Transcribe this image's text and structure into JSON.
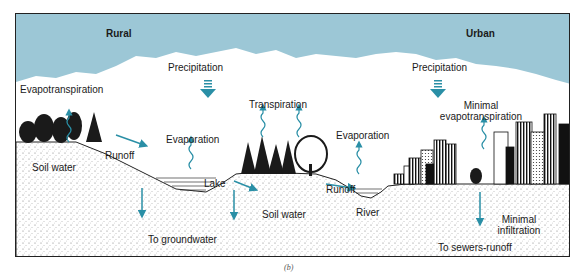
{
  "diagram": {
    "caption": "(b)",
    "colors": {
      "sky": "#9cc7d6",
      "arrow": "#2a8fa6",
      "ink": "#1a1a1a",
      "ground_stipple": "#555555"
    },
    "regions": {
      "rural": "Rural",
      "urban": "Urban"
    },
    "labels": {
      "rural_precipitation": "Precipitation",
      "urban_precipitation": "Precipitation",
      "evapotranspiration": "Evapotranspiration",
      "transpiration": "Transpiration",
      "evaporation_lake": "Evaporation",
      "evaporation_river": "Evaporation",
      "minimal_evapotranspiration_line1": "Minimal",
      "minimal_evapotranspiration_line2": "evapotranspiration",
      "runoff_rural": "Runoff",
      "runoff_river": "Runoff",
      "soil_water_left": "Soil water",
      "soil_water_right": "Soil water",
      "lake": "Lake",
      "river": "River",
      "to_groundwater": "To groundwater",
      "minimal_infiltration_line1": "Minimal",
      "minimal_infiltration_line2": "infiltration",
      "to_sewers_runoff": "To sewers-runoff"
    }
  }
}
